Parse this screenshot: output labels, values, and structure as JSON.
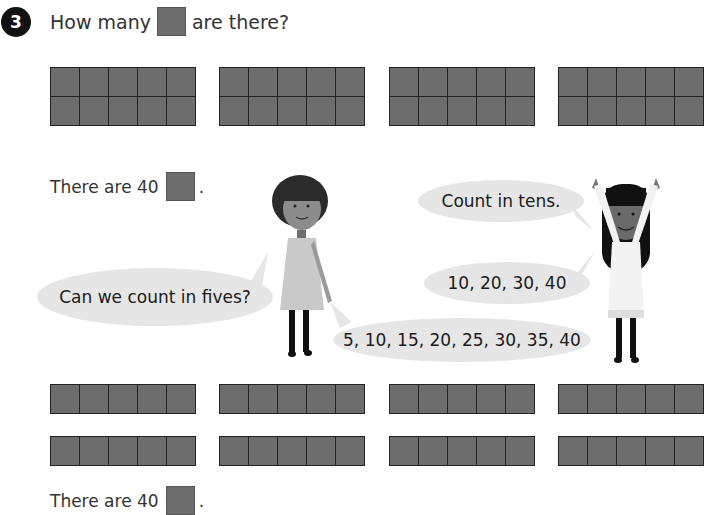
{
  "question": {
    "number": "3",
    "prefix": "How many",
    "suffix": "are there?"
  },
  "top_frames": {
    "count": 4,
    "rows": 2,
    "cols": 5,
    "cell_color": "#6d6d6d"
  },
  "answer_top": {
    "text": "There are 40",
    "period": "."
  },
  "speech": {
    "girl_left_question": "Can we count in fives?",
    "girl_right_prompt": "Count in tens.",
    "tens_count": "10, 20, 30, 40",
    "fives_count": "5, 10, 15, 20, 25, 30, 35, 40"
  },
  "bottom_frames": {
    "count": 8,
    "rows": 1,
    "cols": 5
  },
  "answer_bottom": {
    "text": "There are 40",
    "period": "."
  },
  "colors": {
    "bubble": "#e6e6e6",
    "counter": "#6d6d6d",
    "grid_line": "#222222"
  }
}
